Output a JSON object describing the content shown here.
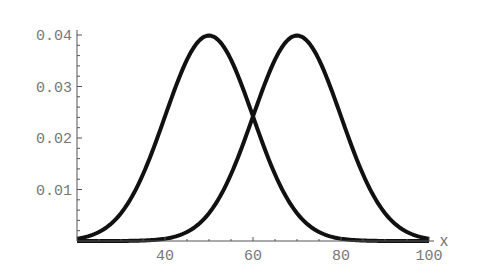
{
  "chart_data": {
    "type": "line",
    "title": "",
    "xlabel": "x",
    "ylabel": "",
    "xlim": [
      20,
      100
    ],
    "ylim": [
      0,
      0.04
    ],
    "grid": false,
    "legend": null,
    "x_ticks": [
      40,
      60,
      80,
      100
    ],
    "x_tick_labels": [
      "40",
      "60",
      "80",
      "100"
    ],
    "y_ticks": [
      0.01,
      0.02,
      0.03,
      0.04
    ],
    "y_tick_labels": [
      "0.01",
      "0.02",
      "0.03",
      "0.04"
    ],
    "series": [
      {
        "name": "Normal(50, 10)",
        "mean": 50,
        "sd": 10,
        "x": [
          20,
          30,
          40,
          45,
          50,
          55,
          60,
          70,
          80,
          90,
          100
        ],
        "values": [
          0.0004,
          0.0054,
          0.0242,
          0.0352,
          0.0399,
          0.0352,
          0.0242,
          0.0054,
          0.0004,
          0.0,
          0.0
        ]
      },
      {
        "name": "Normal(70, 10)",
        "mean": 70,
        "sd": 10,
        "x": [
          20,
          40,
          50,
          60,
          65,
          70,
          75,
          80,
          90,
          100
        ],
        "values": [
          0.0,
          0.0004,
          0.0054,
          0.0242,
          0.0352,
          0.0399,
          0.0352,
          0.0242,
          0.0054,
          0.0004
        ]
      }
    ]
  },
  "colors": {
    "curve": "#111111",
    "axis": "#555555",
    "text": "#777777",
    "background": "#ffffff"
  }
}
